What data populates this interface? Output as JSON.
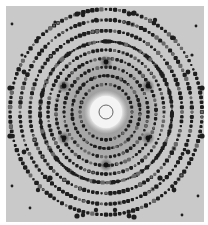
{
  "image": {
    "description": "X-ray diffraction (Laue) pattern with six-fold symmetric spot arrangement",
    "width": 208,
    "height": 225,
    "frame": {
      "x": 6,
      "y": 6,
      "width": 198,
      "height": 216,
      "border_color": "#ffffff"
    },
    "colors": {
      "background": "#c9c9c9",
      "inner_haze": "#9a9a9a",
      "spot": "#1e1e1e",
      "faint_spot": "#6a6a6a",
      "halo": "#f4f4f4",
      "beam_stop_ring": "#444444"
    },
    "center": {
      "x": 106,
      "y": 112
    },
    "halo_radius": 18,
    "beam_stop_ring_radius": 7,
    "inner_haze_radius": 62,
    "hubs": [
      {
        "x": 106,
        "y": 62
      },
      {
        "x": 64,
        "y": 86
      },
      {
        "x": 148,
        "y": 86
      },
      {
        "x": 64,
        "y": 138
      },
      {
        "x": 148,
        "y": 138
      },
      {
        "x": 106,
        "y": 165
      }
    ],
    "ring_radii": [
      26,
      34,
      42,
      50,
      58,
      66,
      76,
      86,
      96
    ],
    "edge_spots": [
      {
        "x": 77,
        "y": 14,
        "r": 2.6
      },
      {
        "x": 83,
        "y": 15,
        "r": 2.2
      },
      {
        "x": 96,
        "y": 20,
        "r": 2.2
      },
      {
        "x": 115,
        "y": 20,
        "r": 2.2
      },
      {
        "x": 129,
        "y": 14,
        "r": 2.4
      },
      {
        "x": 134,
        "y": 13,
        "r": 2.6
      },
      {
        "x": 77,
        "y": 216,
        "r": 2.6
      },
      {
        "x": 83,
        "y": 215,
        "r": 2.2
      },
      {
        "x": 96,
        "y": 210,
        "r": 2.2
      },
      {
        "x": 115,
        "y": 210,
        "r": 2.2
      },
      {
        "x": 129,
        "y": 216,
        "r": 2.4
      },
      {
        "x": 134,
        "y": 217,
        "r": 2.6
      },
      {
        "x": 10,
        "y": 88,
        "r": 2.6
      },
      {
        "x": 10,
        "y": 136,
        "r": 2.6
      },
      {
        "x": 202,
        "y": 88,
        "r": 2.6
      },
      {
        "x": 202,
        "y": 136,
        "r": 2.6
      },
      {
        "x": 24,
        "y": 72,
        "r": 2.4
      },
      {
        "x": 188,
        "y": 72,
        "r": 2.4
      },
      {
        "x": 24,
        "y": 152,
        "r": 2.4
      },
      {
        "x": 188,
        "y": 152,
        "r": 2.4
      },
      {
        "x": 38,
        "y": 38,
        "r": 2.0
      },
      {
        "x": 174,
        "y": 38,
        "r": 2.0
      },
      {
        "x": 38,
        "y": 190,
        "r": 2.2
      },
      {
        "x": 174,
        "y": 190,
        "r": 2.4
      },
      {
        "x": 55,
        "y": 22,
        "r": 1.6
      },
      {
        "x": 155,
        "y": 20,
        "r": 2.2
      },
      {
        "x": 22,
        "y": 55,
        "r": 1.6
      },
      {
        "x": 192,
        "y": 55,
        "r": 1.6
      },
      {
        "x": 160,
        "y": 178,
        "r": 2.6
      },
      {
        "x": 50,
        "y": 178,
        "r": 2.6
      },
      {
        "x": 12,
        "y": 186,
        "r": 1.4
      },
      {
        "x": 198,
        "y": 196,
        "r": 1.4
      },
      {
        "x": 30,
        "y": 208,
        "r": 1.4
      },
      {
        "x": 182,
        "y": 215,
        "r": 1.4
      },
      {
        "x": 12,
        "y": 24,
        "r": 1.4
      },
      {
        "x": 196,
        "y": 26,
        "r": 1.4
      }
    ]
  }
}
